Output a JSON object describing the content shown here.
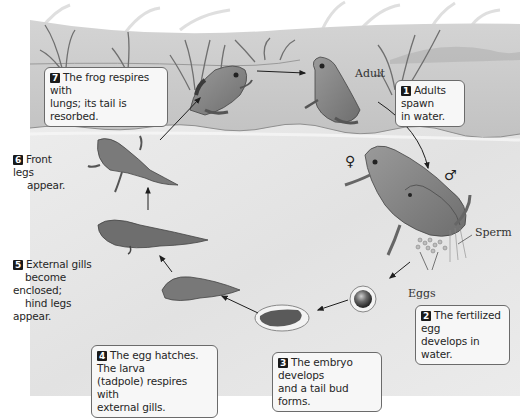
{
  "figure": {
    "background": {
      "land": "#c9c9c9",
      "water": "#e6e6e6",
      "page": "#ffffff"
    }
  },
  "labels": {
    "adult": "Adult",
    "sperm": "Sperm",
    "eggs": "Eggs",
    "female_symbol": "♀",
    "male_symbol": "♂"
  },
  "steps": [
    {
      "number": "1",
      "line1": "Adults spawn",
      "line2": "in water.",
      "line3": ""
    },
    {
      "number": "2",
      "line1": "The fertilized egg",
      "line2": "develops in water.",
      "line3": ""
    },
    {
      "number": "3",
      "line1": "The embryo develops",
      "line2": "and a tail bud forms.",
      "line3": ""
    },
    {
      "number": "4",
      "line1": "The egg hatches. The larva",
      "line2": "(tadpole) respires with",
      "line3": "external gills."
    },
    {
      "number": "5",
      "line1": "External gills",
      "line2": "become enclosed;",
      "line3": "hind legs appear."
    },
    {
      "number": "6",
      "line1": "Front legs",
      "line2": "appear.",
      "line3": ""
    },
    {
      "number": "7",
      "line1": "The frog respires with",
      "line2": "lungs; its tail is resorbed.",
      "line3": ""
    }
  ],
  "icons": {
    "adult_frog": "adult-frog-icon",
    "mating_frogs": "mating-frogs-icon",
    "fertilized_egg": "fertilized-egg-icon",
    "embryo": "embryo-icon",
    "tadpole_gills": "tadpole-icon",
    "tadpole_hind_legs": "tadpole-hind-legs-icon",
    "froglet": "froglet-icon",
    "young_frog": "young-frog-icon"
  }
}
